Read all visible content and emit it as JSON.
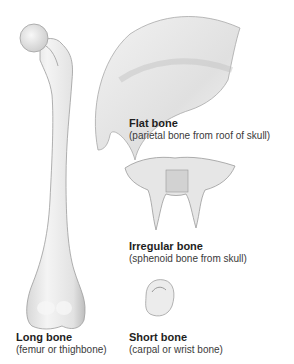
{
  "figure": {
    "items": [
      {
        "id": "flat",
        "title": "Flat bone",
        "subtitle": "(parietal bone from roof of skull)"
      },
      {
        "id": "irregular",
        "title": "Irregular bone",
        "subtitle": "(sphenoid bone from skull)"
      },
      {
        "id": "long",
        "title": "Long bone",
        "subtitle": "(femur or thighbone)"
      },
      {
        "id": "short",
        "title": "Short bone",
        "subtitle": "(carpal or wrist bone)"
      }
    ]
  }
}
